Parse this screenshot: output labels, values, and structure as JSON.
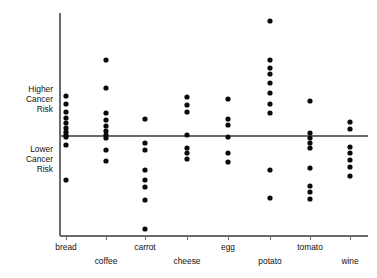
{
  "chart_data": {
    "type": "scatter",
    "title": "",
    "subtitle": "",
    "xlabel": "",
    "ylabel": "",
    "grid": false,
    "legend": "none",
    "axis_ranges": {
      "y_top_pixel": 13,
      "y_bottom_pixel": 236,
      "reference_line_y_pixel": 136
    },
    "y_axis_annotations": [
      {
        "id": "higher",
        "lines": [
          "Higher",
          "Cancer",
          "Risk"
        ],
        "align": "right",
        "y_pixel": 92
      },
      {
        "id": "lower",
        "lines": [
          "Lower",
          "Cancer",
          "Risk"
        ],
        "align": "right",
        "y_pixel": 152
      }
    ],
    "reference_line": {
      "label": "neutral risk baseline",
      "y_pixel": 136
    },
    "categories": [
      "bread",
      "coffee",
      "carrot",
      "cheese",
      "egg",
      "potato",
      "tomato",
      "wine"
    ],
    "category_label_rows": [
      0,
      1,
      0,
      1,
      0,
      1,
      0,
      1
    ],
    "series": [
      {
        "name": "bread",
        "x_pixel": 66,
        "values_y_pixel": [
          96,
          104,
          112,
          118,
          123,
          128,
          132,
          135,
          137,
          145,
          180
        ]
      },
      {
        "name": "coffee",
        "x_pixel": 106,
        "values_y_pixel": [
          60,
          88,
          113,
          120,
          126,
          131,
          135,
          138,
          150,
          161
        ]
      },
      {
        "name": "carrot",
        "x_pixel": 145,
        "values_y_pixel": [
          119,
          143,
          150,
          170,
          180,
          187,
          200,
          229
        ]
      },
      {
        "name": "cheese",
        "x_pixel": 187,
        "values_y_pixel": [
          97,
          105,
          112,
          135,
          148,
          153,
          159
        ]
      },
      {
        "name": "egg",
        "x_pixel": 228,
        "values_y_pixel": [
          99,
          119,
          125,
          137,
          153,
          162
        ]
      },
      {
        "name": "potato",
        "x_pixel": 270,
        "values_y_pixel": [
          21,
          60,
          68,
          74,
          83,
          93,
          104,
          113,
          170,
          198
        ]
      },
      {
        "name": "tomato",
        "x_pixel": 310,
        "values_y_pixel": [
          101,
          133,
          138,
          143,
          148,
          168,
          186,
          192,
          199
        ]
      },
      {
        "name": "wine",
        "x_pixel": 350,
        "values_y_pixel": [
          122,
          129,
          147,
          153,
          160,
          167,
          176
        ]
      }
    ],
    "colors": {
      "dot": "#0a0a0a",
      "axis": "#6b6b6b",
      "text": "#111111",
      "background": "#ffffff"
    },
    "dot_radius": 2.6
  }
}
